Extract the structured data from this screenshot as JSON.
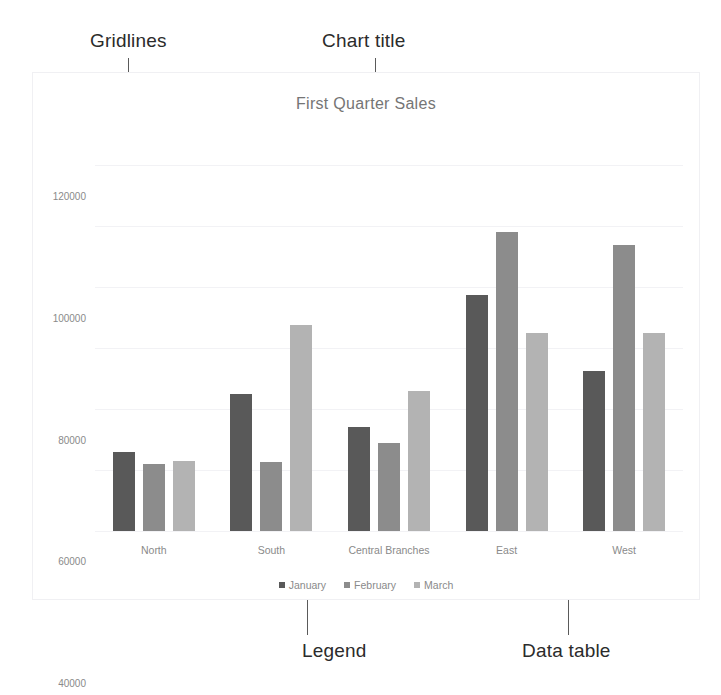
{
  "annotations": [
    {
      "id": "gridlines",
      "label": "Gridlines"
    },
    {
      "id": "chart-title",
      "label": "Chart title"
    },
    {
      "id": "legend",
      "label": "Legend"
    },
    {
      "id": "data-table",
      "label": "Data table"
    }
  ],
  "colors": {
    "january": "#595959",
    "february": "#8c8c8c",
    "march": "#b3b3b3",
    "gridline": "#f2f2f5",
    "axis_text": "#8a8a8a",
    "title_text": "#757575",
    "callout_text": "#2b2b2b",
    "leader_line": "#5a5a5a",
    "chart_border": "#f0f0f3"
  },
  "chart_data": {
    "type": "bar",
    "title": "First Quarter Sales",
    "xlabel": "Branches",
    "ylabel": "",
    "categories": [
      "North",
      "South",
      "Central Branches",
      "East",
      "West"
    ],
    "series": [
      {
        "name": "January",
        "values": [
          26000,
          45000,
          34000,
          77500,
          52500
        ]
      },
      {
        "name": "February",
        "values": [
          22000,
          22500,
          29000,
          98000,
          94000
        ]
      },
      {
        "name": "March",
        "values": [
          23000,
          67500,
          46000,
          65000,
          65000
        ]
      }
    ],
    "ylim": [
      0,
      130000
    ],
    "yticks": [
      0,
      20000,
      40000,
      60000,
      80000,
      100000,
      120000
    ],
    "ytick_labels": [
      "0",
      "20000",
      "40000",
      "60000",
      "80000",
      "100000",
      "120000"
    ],
    "grid": true,
    "legend_position": "bottom"
  }
}
